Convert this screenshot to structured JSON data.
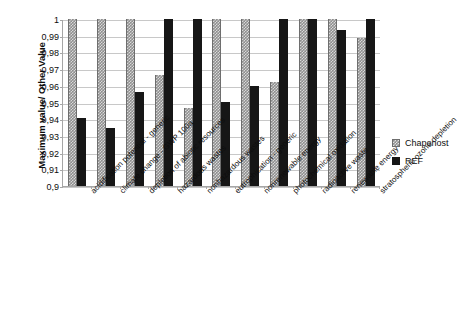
{
  "chart_data": {
    "type": "bar",
    "title": "",
    "xlabel": "",
    "ylabel": "Maximum value/ Other Value",
    "ylim": [
      0.9,
      1.0
    ],
    "grid": true,
    "legend_position": "right",
    "ytick_labels": [
      "1",
      "0,99",
      "0,98",
      "0,97",
      "0,96",
      "0,95",
      "0,94",
      "0,93",
      "0,92",
      "0,91",
      "0,9"
    ],
    "ytick_values": [
      1.0,
      0.99,
      0.98,
      0.97,
      0.96,
      0.95,
      0.94,
      0.93,
      0.92,
      0.91,
      0.9
    ],
    "categories": [
      "acidification potential - generic",
      "climate change - GWP 100a",
      "depletion of abiotic resources",
      "hazardous wastes",
      "nonhazardous wastes",
      "eutrophication - generic",
      "nonrenewable energy",
      "photochemical oxidation",
      "radioactive waste",
      "renewable energy",
      "stratospheric ozone depletion"
    ],
    "series": [
      {
        "name": "Chaponost",
        "color": "#8f8f8f",
        "pattern": "dotted",
        "values": [
          1.0,
          1.0,
          1.0,
          0.9665,
          0.9465,
          1.0,
          1.0,
          0.962,
          1.0,
          1.0,
          0.9885
        ]
      },
      {
        "name": "REF",
        "color": "#161616",
        "pattern": "solid",
        "values": [
          0.941,
          0.9345,
          0.956,
          1.0,
          1.0,
          0.9505,
          0.96,
          1.0,
          1.0,
          0.9935,
          1.0
        ]
      }
    ]
  },
  "legend": {
    "items": [
      {
        "label": "Chaponost"
      },
      {
        "label": "REF"
      }
    ]
  }
}
